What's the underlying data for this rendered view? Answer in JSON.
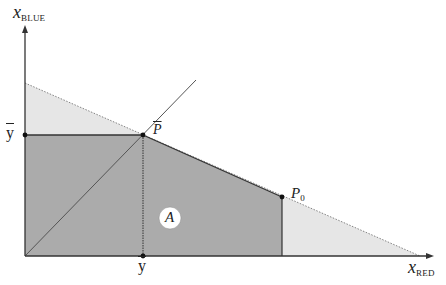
{
  "diagram": {
    "axes": {
      "y_label_main": "x",
      "y_label_sub": "BLUE",
      "x_label_main": "x",
      "x_label_sub": "RED"
    },
    "points": {
      "p_bar_main": "P",
      "p0_main": "P",
      "p0_sub": "0"
    },
    "ticks": {
      "y_bar_left": "y",
      "y_bar_bottom": "y"
    },
    "region_label": "A",
    "colors": {
      "dark_region": "#a9a9a9",
      "light_region": "#e4e4e4",
      "axis": "#333333",
      "line": "#444444"
    }
  }
}
